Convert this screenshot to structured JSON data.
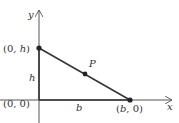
{
  "diagram": {
    "type": "coordinate-triangle",
    "colors": {
      "line": "#333333",
      "axis": "#555555",
      "text": "#333333"
    },
    "axes": {
      "x_label": "x",
      "y_label": "y"
    },
    "points": [
      {
        "id": "origin",
        "label_open": "(0, 0)",
        "coords": "(0, 0)"
      },
      {
        "id": "top",
        "label_open": "(0, ",
        "label_var": "h",
        "label_close": ")"
      },
      {
        "id": "right",
        "label_open": "(",
        "label_var": "b",
        "label_close": ", 0)"
      },
      {
        "id": "P",
        "label": "P"
      }
    ],
    "segment_labels": {
      "height": "h",
      "base": "b"
    }
  }
}
